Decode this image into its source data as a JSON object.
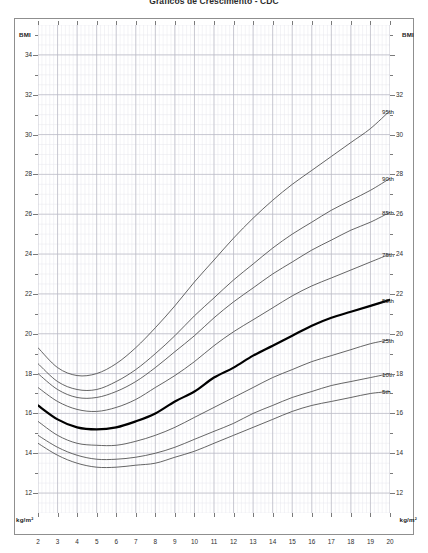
{
  "page": {
    "top_title": "Gráficos de Crescimento - CDC"
  },
  "chart_title": {
    "line1": "Percentil de IMC por idade:",
    "line2": "Meninas de 2 a 20 anos"
  },
  "axis_labels": {
    "bmi_top_left": "BMI",
    "bmi_top_right": "BMI",
    "unit_bottom_left": "kg/m²",
    "unit_bottom_right": "kg/m²"
  },
  "chart_data": {
    "type": "line",
    "title": "Percentil de IMC por idade: Meninas de 2 a 20 anos",
    "subtitle": "Gráficos de Crescimento - CDC",
    "xlabel": "",
    "ylabel": "BMI",
    "unit": "kg/m²",
    "xlim": [
      2,
      20
    ],
    "ylim": [
      11,
      35.5
    ],
    "grid": true,
    "legend_position": "right-inline-labels",
    "x_ticks": [
      2,
      3,
      4,
      5,
      6,
      7,
      8,
      9,
      10,
      11,
      12,
      13,
      14,
      15,
      16,
      17,
      18,
      19,
      20
    ],
    "y_ticks": [
      12,
      14,
      16,
      18,
      20,
      22,
      24,
      26,
      28,
      30,
      32,
      34
    ],
    "y_ticks_right": [
      12,
      14,
      16,
      18,
      20,
      22,
      24,
      26,
      28,
      30,
      32
    ],
    "x": [
      2,
      3,
      4,
      5,
      6,
      7,
      8,
      9,
      10,
      11,
      12,
      13,
      14,
      15,
      16,
      17,
      18,
      19,
      20
    ],
    "series": [
      {
        "name": "95th",
        "label": "95th",
        "emphasis": false,
        "values": [
          19.3,
          18.3,
          17.9,
          18.0,
          18.5,
          19.3,
          20.3,
          21.4,
          22.6,
          23.7,
          24.8,
          25.8,
          26.7,
          27.5,
          28.2,
          28.9,
          29.6,
          30.3,
          31.2
        ]
      },
      {
        "name": "90th",
        "label": "90th",
        "emphasis": false,
        "values": [
          18.5,
          17.6,
          17.2,
          17.2,
          17.6,
          18.2,
          19.0,
          19.9,
          20.9,
          21.8,
          22.7,
          23.5,
          24.3,
          25.0,
          25.6,
          26.2,
          26.7,
          27.2,
          27.8
        ]
      },
      {
        "name": "85th",
        "label": "85th",
        "emphasis": false,
        "values": [
          18.0,
          17.2,
          16.8,
          16.8,
          17.1,
          17.6,
          18.3,
          19.1,
          19.9,
          20.8,
          21.6,
          22.3,
          23.0,
          23.6,
          24.2,
          24.7,
          25.2,
          25.6,
          26.1
        ]
      },
      {
        "name": "75th",
        "label": "75th",
        "emphasis": false,
        "values": [
          17.3,
          16.6,
          16.2,
          16.1,
          16.3,
          16.7,
          17.3,
          17.9,
          18.6,
          19.4,
          20.1,
          20.7,
          21.3,
          21.9,
          22.4,
          22.8,
          23.2,
          23.6,
          24.0
        ]
      },
      {
        "name": "50th",
        "label": "50th",
        "emphasis": true,
        "values": [
          16.4,
          15.7,
          15.3,
          15.2,
          15.3,
          15.6,
          16.0,
          16.6,
          17.1,
          17.8,
          18.3,
          18.9,
          19.4,
          19.9,
          20.4,
          20.8,
          21.1,
          21.4,
          21.7
        ]
      },
      {
        "name": "25th",
        "label": "25th",
        "emphasis": false,
        "values": [
          15.6,
          14.9,
          14.5,
          14.4,
          14.4,
          14.6,
          14.9,
          15.3,
          15.8,
          16.3,
          16.8,
          17.3,
          17.8,
          18.2,
          18.6,
          18.9,
          19.2,
          19.5,
          19.7
        ]
      },
      {
        "name": "10th",
        "label": "10th",
        "emphasis": false,
        "values": [
          14.9,
          14.3,
          13.9,
          13.7,
          13.7,
          13.8,
          14.0,
          14.3,
          14.7,
          15.1,
          15.5,
          16.0,
          16.4,
          16.8,
          17.1,
          17.4,
          17.6,
          17.8,
          18.0
        ]
      },
      {
        "name": "5th",
        "label": "5th",
        "emphasis": false,
        "values": [
          14.5,
          13.9,
          13.5,
          13.3,
          13.3,
          13.4,
          13.5,
          13.8,
          14.1,
          14.5,
          14.9,
          15.3,
          15.7,
          16.1,
          16.4,
          16.6,
          16.8,
          17.0,
          17.1
        ]
      }
    ],
    "label_positions": {
      "95th": 31.2,
      "90th": 27.8,
      "85th": 26.1,
      "75th": 24.0,
      "50th": 21.7,
      "25th": 19.7,
      "10th": 18.0,
      "5th": 17.1
    }
  },
  "colors": {
    "curve": "#4a4a4a",
    "curve_bold": "#000000",
    "grid_minor": "#e6e6ec",
    "grid_major": "#b9b9c4",
    "frame": "#8f8f8f",
    "text": "#2e2e2e"
  }
}
